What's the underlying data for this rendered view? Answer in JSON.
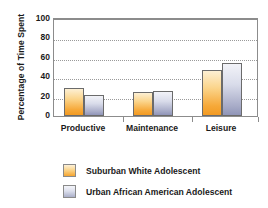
{
  "chart_data": {
    "type": "bar",
    "title": "",
    "subtitle": "",
    "xlabel": "",
    "ylabel": "Percentage of Time Spent",
    "categories": [
      "Productive",
      "Maintenance",
      "Leisure"
    ],
    "series": [
      {
        "name": "Suburban White Adolescent",
        "values": [
          29,
          25,
          47
        ],
        "color": "#f5a531"
      },
      {
        "name": "Urban African American Adolescent",
        "values": [
          22,
          26,
          55
        ],
        "color": "#aaafc9"
      }
    ],
    "ylim": [
      0,
      100
    ],
    "yticks": [
      100,
      80,
      60,
      40,
      20,
      0
    ],
    "ytick_labels": [
      "100",
      "80",
      "60",
      "40",
      "20",
      "0"
    ],
    "grid": "horizontal-dotted",
    "legend_position": "bottom-left",
    "annotations": []
  },
  "legend": {
    "entries": [
      {
        "label": "Suburban White Adolescent"
      },
      {
        "label": "Urban African American Adolescent"
      }
    ]
  },
  "colors": {
    "series_a": "#f5a531",
    "series_b": "#aaafc9",
    "axis": "#8c8c8c",
    "grid": "#9a9a9a",
    "text": "#1a1a1a",
    "background": "#ffffff"
  }
}
